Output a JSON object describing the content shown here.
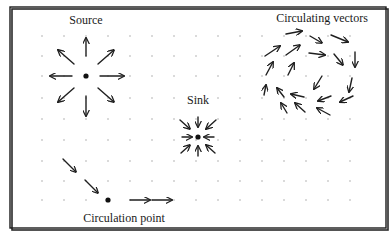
{
  "figure": {
    "colors": {
      "ink": "#1f1f1f",
      "grid": "#9a9a9a",
      "background": "#ffffff"
    },
    "frame": {
      "x": 10,
      "y": 7,
      "width": 376,
      "height": 221
    },
    "grid": {
      "x": [
        42,
        64,
        86,
        108,
        130,
        152,
        174,
        196,
        218,
        240,
        262,
        284,
        306,
        328,
        350
      ],
      "y": [
        36,
        56,
        76,
        98,
        119,
        140,
        161,
        181,
        201
      ]
    },
    "labels": {
      "source": "Source",
      "sink": "Sink",
      "circulating": "Circulating vectors",
      "circulation_point": "Circulation point"
    },
    "source": {
      "center": [
        86,
        76
      ],
      "vectors": [
        [
          86,
          56,
          86,
          38
        ],
        [
          74,
          64,
          58,
          50
        ],
        [
          98,
          64,
          114,
          50
        ],
        [
          72,
          76,
          50,
          76
        ],
        [
          100,
          76,
          124,
          76
        ],
        [
          74,
          88,
          58,
          102
        ],
        [
          86,
          96,
          86,
          116
        ],
        [
          98,
          88,
          114,
          102
        ]
      ]
    },
    "sink": {
      "center": [
        198,
        137
      ],
      "vectors": [
        [
          198,
          117,
          198,
          127
        ],
        [
          180,
          120,
          190,
          129
        ],
        [
          216,
          120,
          206,
          129
        ],
        [
          182,
          137,
          192,
          137
        ],
        [
          214,
          137,
          204,
          137
        ],
        [
          181,
          153,
          190,
          145
        ],
        [
          198,
          156,
          198,
          146
        ],
        [
          215,
          153,
          206,
          145
        ]
      ]
    },
    "circulating": {
      "vectors": [
        [
          286,
          34,
          302,
          31
        ],
        [
          310,
          36,
          322,
          43
        ],
        [
          331,
          35,
          348,
          42
        ],
        [
          265,
          56,
          280,
          46
        ],
        [
          286,
          55,
          300,
          45
        ],
        [
          309,
          53,
          325,
          55
        ],
        [
          334,
          54,
          343,
          65
        ],
        [
          355,
          52,
          355,
          67
        ],
        [
          266,
          75,
          273,
          62
        ],
        [
          288,
          75,
          294,
          63
        ],
        [
          322,
          76,
          314,
          89
        ],
        [
          352,
          78,
          349,
          92
        ],
        [
          264,
          95,
          266,
          85
        ],
        [
          284,
          97,
          277,
          88
        ],
        [
          304,
          97,
          291,
          94
        ],
        [
          331,
          96,
          318,
          101
        ],
        [
          353,
          96,
          340,
          102
        ],
        [
          287,
          113,
          281,
          103
        ],
        [
          305,
          112,
          295,
          103
        ],
        [
          330,
          115,
          317,
          108
        ]
      ]
    },
    "circulation": {
      "point": [
        108,
        200
      ],
      "vectors": [
        [
          63,
          159,
          76,
          172
        ],
        [
          85,
          180,
          98,
          193
        ],
        [
          130,
          200,
          150,
          200
        ],
        [
          152,
          200,
          172,
          200
        ]
      ]
    }
  }
}
